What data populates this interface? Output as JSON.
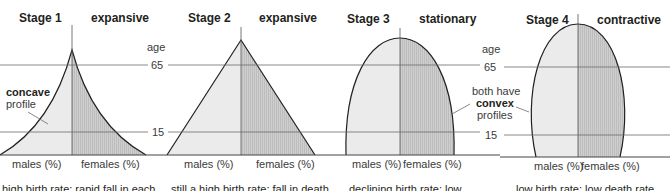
{
  "diagram": {
    "type": "population-pyramids",
    "colors": {
      "male_fill": "#ebebeb",
      "female_fill": "#c9c9c9",
      "outline": "#231f20",
      "gridline": "#6b6b6b"
    },
    "age_axis": {
      "label": "age",
      "tick_65": "65",
      "tick_15": "15"
    },
    "stages": [
      {
        "title": "Stage 1",
        "type": "expansive",
        "male_label": "males (%)",
        "female_label": "females (%)",
        "caption": "high birth rate; rapid fall in each"
      },
      {
        "title": "Stage 2",
        "type": "expansive",
        "male_label": "males (%)",
        "female_label": "females (%)",
        "caption": "still a high birth rate; fall in death"
      },
      {
        "title": "Stage 3",
        "type": "stationary",
        "male_label": "males (%)",
        "female_label": "females (%)",
        "caption": "declining birth rate; low"
      },
      {
        "title": "Stage 4",
        "type": "contractive",
        "male_label": "males (%)",
        "female_label": "females (%)",
        "caption": "low birth rate; low death rate"
      }
    ],
    "annotations": {
      "concave_bold": "concave",
      "concave_rest": "profile",
      "convex_line1": "both have",
      "convex_bold": "convex",
      "convex_line3": "profiles"
    }
  }
}
